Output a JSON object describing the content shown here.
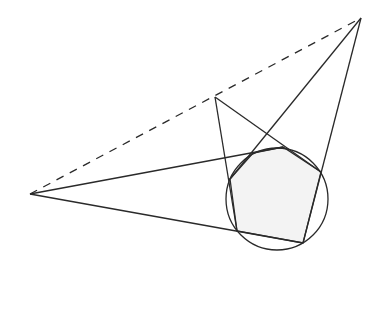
{
  "diagram": {
    "type": "geometric-construction",
    "colors": {
      "background": "#ffffff",
      "stroke": "#2a2a2a",
      "fill": "#f3f3f3"
    },
    "points": {
      "left_apex": [
        30,
        194
      ],
      "top_apex": [
        361,
        18
      ],
      "middle_apex": [
        215,
        97
      ],
      "P1": [
        230,
        179
      ],
      "P2": [
        253,
        153
      ],
      "P3": [
        283,
        147
      ],
      "P4": [
        321,
        172
      ],
      "P5": [
        303,
        243
      ],
      "P6": [
        237,
        231
      ]
    },
    "circle": {
      "cx": 277,
      "cy": 199,
      "r": 51
    },
    "dashed_line": {
      "from": "left_apex",
      "to": "top_apex"
    },
    "lines": [
      {
        "from": "top_apex",
        "to": "P1"
      },
      {
        "from": "top_apex",
        "to": "P5"
      },
      {
        "from": "left_apex",
        "to": "P3"
      },
      {
        "from": "left_apex",
        "to": "P5"
      },
      {
        "from": "middle_apex",
        "to": "P6"
      },
      {
        "from": "middle_apex",
        "to": "P4"
      }
    ],
    "polygon": [
      "P1",
      "P2",
      "P3",
      "P4",
      "P5",
      "P6"
    ]
  }
}
